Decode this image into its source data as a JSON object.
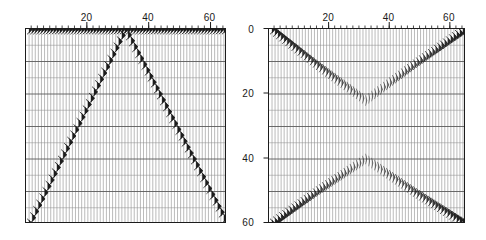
{
  "figure": {
    "background_color": "#ffffff",
    "line_color": "#1c1c1c",
    "grid_color": "#5a5a5a",
    "minor_grid_color": "#8c8c8c"
  },
  "chart_data": [
    {
      "id": "left-panel",
      "type": "line",
      "title": "",
      "subtitle": "",
      "xlabel": "",
      "ylabel": "",
      "x_axis_position": "top",
      "y_axis_position": "none",
      "xlim": [
        0,
        65
      ],
      "ylim": [
        60,
        0
      ],
      "y_inverted": true,
      "grid": true,
      "legend": null,
      "xticks": [
        20,
        40,
        60
      ],
      "xtick_labels": [
        "20",
        "40",
        "60"
      ],
      "xminor_tick_interval": 2,
      "yticks": [
        0,
        20,
        40,
        60
      ],
      "ytick_labels": [
        "0",
        "20",
        "40",
        "60"
      ],
      "y_major_gridline_interval": 10,
      "y_minor_gridline_interval": 5,
      "trace_count": 65,
      "description": "Variable-area wiggle-trace seismic display; single linear V-shaped event with apex at trace 32, time 0",
      "series": [
        {
          "name": "event-ascending",
          "comment": "time decreases linearly from trace 1 to trace 32",
          "x": [
            1,
            32
          ],
          "values": [
            60,
            0
          ]
        },
        {
          "name": "event-descending",
          "comment": "time increases linearly from trace 32 to trace 65",
          "x": [
            32,
            65
          ],
          "values": [
            0,
            60
          ]
        }
      ]
    },
    {
      "id": "right-panel",
      "type": "line",
      "title": "",
      "subtitle": "",
      "xlabel": "",
      "ylabel": "",
      "x_axis_position": "top",
      "y_axis_position": "left",
      "xlim": [
        0,
        65
      ],
      "ylim": [
        60,
        0
      ],
      "y_inverted": true,
      "grid": true,
      "legend": null,
      "xticks": [
        20,
        40,
        60
      ],
      "xtick_labels": [
        "20",
        "40",
        "60"
      ],
      "xminor_tick_interval": 2,
      "yticks": [
        0,
        20,
        40,
        60
      ],
      "ytick_labels": [
        "0",
        "20",
        "40",
        "60"
      ],
      "y_major_gridline_interval": 10,
      "y_minor_gridline_interval": 5,
      "trace_count": 65,
      "description": "Variable-area wiggle-trace seismic display; two crossing hyperbolic/linear events forming an X, crossing near trace 32",
      "series": [
        {
          "name": "event-upper-v",
          "comment": "upper event: starts at time 0 on both edges, sags to ~22 at center trace 32",
          "x": [
            1,
            16,
            32,
            48,
            65
          ],
          "values": [
            0,
            11,
            22,
            11,
            0
          ]
        },
        {
          "name": "event-lower-inverted-v",
          "comment": "lower event: starts at time 60 on both edges, arches to ~40 at center trace 32",
          "x": [
            1,
            16,
            32,
            48,
            65
          ],
          "values": [
            60,
            50,
            40,
            50,
            60
          ]
        }
      ]
    }
  ],
  "axes": {
    "shared_y_labels": [
      "0",
      "20",
      "40",
      "60"
    ]
  }
}
